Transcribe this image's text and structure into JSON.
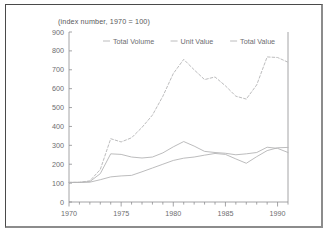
{
  "figure": {
    "subtitle": "(index number, 1970 = 100)",
    "background_color": "#ffffff",
    "frame_color": "#4a4a4a",
    "line_color": "#b4b4b6",
    "axis_color": "#8e8e90",
    "text_color": "#6d6d6f"
  },
  "chart_data": {
    "type": "line",
    "title": "",
    "subtitle": "(index number, 1970 = 100)",
    "xlabel": "",
    "ylabel": "",
    "xlim": [
      1970,
      1991
    ],
    "ylim": [
      0,
      900
    ],
    "ytick_labels": [
      "0",
      "100",
      "200",
      "300",
      "400",
      "500",
      "600",
      "700",
      "800",
      "900"
    ],
    "ytick_values": [
      0,
      100,
      200,
      300,
      400,
      500,
      600,
      700,
      800,
      900
    ],
    "xtick_labels": [
      "1970",
      "1975",
      "1980",
      "1985",
      "1990"
    ],
    "xtick_values": [
      1970,
      1975,
      1980,
      1985,
      1990
    ],
    "xtick_minor_values": [
      1971,
      1972,
      1973,
      1974,
      1976,
      1977,
      1978,
      1979,
      1981,
      1982,
      1983,
      1984,
      1986,
      1987,
      1988,
      1989,
      1991
    ],
    "grid": false,
    "legend_position": "top-center",
    "x": [
      1970,
      1971,
      1972,
      1973,
      1974,
      1975,
      1976,
      1977,
      1978,
      1979,
      1980,
      1981,
      1982,
      1983,
      1984,
      1985,
      1986,
      1987,
      1988,
      1989,
      1990,
      1991
    ],
    "series": [
      {
        "name": "Total Volume",
        "style": "solid",
        "values": [
          103,
          104,
          105,
          118,
          133,
          138,
          141,
          160,
          180,
          200,
          220,
          232,
          238,
          248,
          257,
          252,
          228,
          205,
          240,
          272,
          287,
          289
        ]
      },
      {
        "name": "Unit Value",
        "style": "solid",
        "values": [
          104,
          104,
          108,
          150,
          255,
          252,
          238,
          233,
          238,
          260,
          292,
          320,
          296,
          268,
          262,
          258,
          250,
          255,
          262,
          290,
          284,
          262
        ]
      },
      {
        "name": "Total Value",
        "style": "dashed",
        "values": [
          104,
          104,
          112,
          172,
          335,
          318,
          340,
          395,
          460,
          560,
          680,
          755,
          700,
          648,
          662,
          615,
          560,
          545,
          620,
          768,
          765,
          740
        ]
      }
    ]
  },
  "legend": {
    "items": [
      {
        "label": "Total Volume",
        "style": "solid"
      },
      {
        "label": "Unit Value",
        "style": "solid"
      },
      {
        "label": "Total Value",
        "style": "solid"
      }
    ]
  }
}
